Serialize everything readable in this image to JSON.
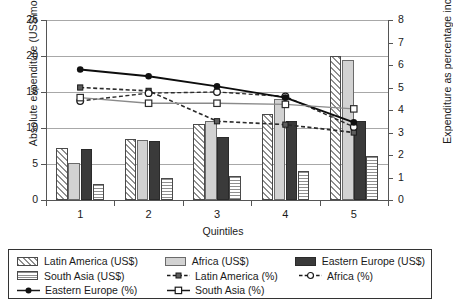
{
  "chart_data": {
    "type": "bar",
    "title": "",
    "xlabel": "Quintiles",
    "ylabel": "Absolute expenditure (US$/month)",
    "y2label": "Expenditure as percentage income",
    "categories": [
      "1",
      "2",
      "3",
      "4",
      "5"
    ],
    "ylim": [
      0,
      25
    ],
    "y2lim": [
      0,
      8
    ],
    "yticks": [
      "0",
      "5",
      "10",
      "15",
      "20",
      "25"
    ],
    "y2ticks": [
      "0",
      "1",
      "2",
      "3",
      "4",
      "5",
      "6",
      "7",
      "8"
    ],
    "grid": true,
    "legend_position": "bottom",
    "bar_series": [
      {
        "name": "Latin America (US$)",
        "axis": "left",
        "pattern": "diagonal-hatch",
        "values": [
          7.2,
          8.5,
          10.5,
          12.0,
          20.0
        ]
      },
      {
        "name": "Africa (US$)",
        "axis": "left",
        "pattern": "light-gray-solid",
        "values": [
          5.1,
          8.4,
          11.0,
          14.0,
          19.5
        ]
      },
      {
        "name": "Eastern Europe (US$)",
        "axis": "left",
        "pattern": "dark-solid",
        "values": [
          7.1,
          8.2,
          8.8,
          11.0,
          11.0
        ]
      },
      {
        "name": "South Asia (US$)",
        "axis": "left",
        "pattern": "horizontal-lines",
        "values": [
          2.2,
          3.0,
          3.4,
          4.0,
          6.1
        ]
      }
    ],
    "line_series": [
      {
        "name": "Latin America (%)",
        "axis": "right",
        "marker": "filled-square",
        "style": "dashed",
        "values": [
          5.0,
          4.85,
          3.5,
          3.35,
          3.0
        ]
      },
      {
        "name": "Africa (%)",
        "axis": "right",
        "marker": "open-circle",
        "style": "dashed",
        "values": [
          4.4,
          4.75,
          4.8,
          4.6,
          3.25
        ]
      },
      {
        "name": "Eastern Europe (%)",
        "axis": "right",
        "marker": "filled-circle",
        "style": "solid",
        "values": [
          5.8,
          5.5,
          5.05,
          4.55,
          3.45
        ]
      },
      {
        "name": "South Asia (%)",
        "axis": "right",
        "marker": "open-square",
        "style": "solid",
        "values": [
          4.55,
          4.3,
          4.3,
          4.25,
          4.05
        ]
      }
    ]
  },
  "legend": {
    "rows": [
      [
        {
          "label": "Latin America (US$)",
          "swatch": "sw-latin",
          "kind": "patch"
        },
        {
          "label": "Africa (US$)",
          "swatch": "sw-africa",
          "kind": "patch"
        },
        {
          "label": "Eastern Europe (US$)",
          "swatch": "sw-east",
          "kind": "patch"
        }
      ],
      [
        {
          "label": "South Asia (US$)",
          "swatch": "sw-south",
          "kind": "patch"
        },
        {
          "label": "Latin America (%)",
          "swatch": "line-sq-filled",
          "kind": "line"
        },
        {
          "label": "Africa (%)",
          "swatch": "line-ci-open",
          "kind": "line"
        }
      ],
      [
        {
          "label": "Eastern Europe (%)",
          "swatch": "line-ci-filled",
          "kind": "line"
        },
        {
          "label": "South Asia (%)",
          "swatch": "line-sq-open",
          "kind": "line"
        }
      ]
    ]
  },
  "colors": {
    "latin_america": "#8f8f8f",
    "africa": "#d2d2d2",
    "eastern_europe": "#3a3a3a",
    "south_asia": "#8f8f8f",
    "grid": "#a8a8a8",
    "axis": "#555555"
  }
}
